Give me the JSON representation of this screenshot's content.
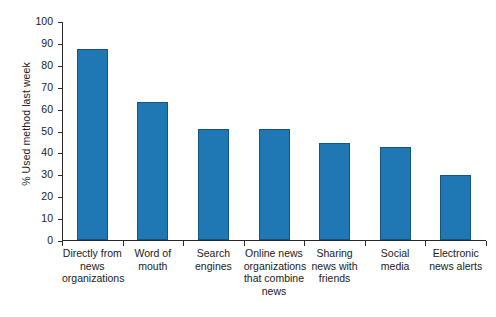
{
  "chart_data": {
    "type": "bar",
    "title": "",
    "xlabel": "",
    "ylabel": "% Used method last week",
    "ylim": [
      0,
      100
    ],
    "ytick_labels": [
      "0",
      "10",
      "20",
      "30",
      "40",
      "50",
      "60",
      "70",
      "80",
      "90",
      "100"
    ],
    "ytick_values": [
      0,
      10,
      20,
      30,
      40,
      50,
      60,
      70,
      80,
      90,
      100
    ],
    "grid": false,
    "legend": "none",
    "bar_color": "#1f77b4",
    "bar_edge_color": "#15547f",
    "axis_color": "#2b2b2b",
    "categories": [
      "Directly from news organizations",
      "Word of mouth",
      "Search engines",
      "Online news organizations that combine news",
      "Sharing news with friends",
      "Social media",
      "Electronic news alerts"
    ],
    "category_lines": [
      [
        "Directly from",
        "news",
        "organizations"
      ],
      [
        "Word of",
        "mouth"
      ],
      [
        "Search",
        "engines"
      ],
      [
        "Online news",
        "organizations",
        "that combine",
        "news"
      ],
      [
        "Sharing",
        "news with",
        "friends"
      ],
      [
        "Social",
        "media"
      ],
      [
        "Electronic",
        "news alerts"
      ]
    ],
    "values": [
      87,
      63,
      50.5,
      50.5,
      44.5,
      42.5,
      29.5
    ]
  }
}
